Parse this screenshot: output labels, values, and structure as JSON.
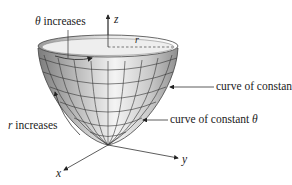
{
  "diagram": {
    "type": "paraboloid-surface-with-polar-coordinates",
    "labels": {
      "theta_increases": {
        "symbol": "θ",
        "text": " increases"
      },
      "r_increases": {
        "symbol": "r",
        "text": " increases"
      },
      "curve_constant_r": {
        "text": "curve of constant ",
        "symbol": "r"
      },
      "curve_constant_theta": {
        "text": "curve of constant ",
        "symbol": "θ"
      },
      "radius": "r",
      "axis_x": "x",
      "axis_y": "y",
      "axis_z": "z"
    },
    "colors": {
      "surface_light": "#f2f2f2",
      "surface_dark": "#8a8a8a",
      "grid_lines": "#333333",
      "text": "#222222"
    }
  }
}
